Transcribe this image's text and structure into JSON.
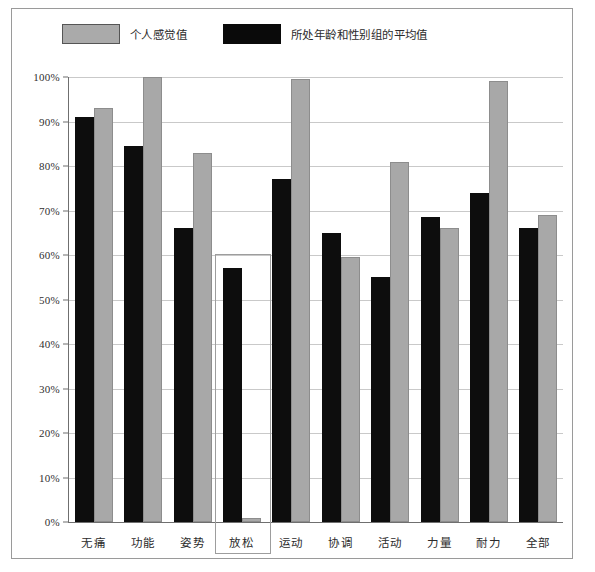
{
  "chart_data": {
    "type": "bar",
    "title": "",
    "xlabel": "",
    "ylabel": "",
    "ylim": [
      0,
      100
    ],
    "grid": true,
    "legend_position": "top-left",
    "categories": [
      "无痛",
      "功能",
      "姿势",
      "放松",
      "运动",
      "协调",
      "活动",
      "力量",
      "耐力",
      "全部"
    ],
    "y_ticks": [
      "0%",
      "10%",
      "20%",
      "30%",
      "40%",
      "50%",
      "60%",
      "70%",
      "80%",
      "90%",
      "100%"
    ],
    "y_tick_values": [
      0,
      10,
      20,
      30,
      40,
      50,
      60,
      70,
      80,
      90,
      100
    ],
    "series": [
      {
        "name": "所处年龄和性别组的平均值",
        "color": "#0d0d0d",
        "values": [
          91,
          84.5,
          66,
          57,
          77,
          65,
          55,
          68.5,
          74,
          66
        ]
      },
      {
        "name": "个人感觉值",
        "color": "#a8a8a8",
        "values": [
          93,
          100,
          83,
          1,
          99.5,
          59.5,
          81,
          66,
          99,
          69
        ]
      }
    ],
    "highlighted_category": "放松"
  },
  "legend": {
    "items": [
      {
        "label": "个人感觉值",
        "swatch": "personal"
      },
      {
        "label": "所处年龄和性别组的平均值",
        "swatch": "average"
      }
    ]
  },
  "colors": {
    "personal": "#a8a8a8",
    "average": "#0d0d0d",
    "grid": "#c9c9c9",
    "axis": "#6f6f6f",
    "frame": "#9a9a9a",
    "highlight": "#9d9d9d"
  }
}
